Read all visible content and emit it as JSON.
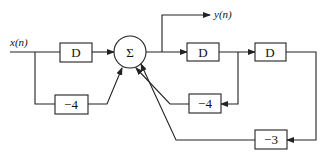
{
  "diagram": {
    "input_label": "x(n)",
    "output_label": "y(n)",
    "sum_symbol": "Σ",
    "blocks": [
      {
        "id": "delay-input",
        "label": "D"
      },
      {
        "id": "gain-input",
        "label": "−4"
      },
      {
        "id": "delay-1",
        "label": "D"
      },
      {
        "id": "delay-2",
        "label": "D"
      },
      {
        "id": "gain-feedback-1",
        "label": "−4"
      },
      {
        "id": "gain-feedback-2",
        "label": "−3"
      }
    ]
  }
}
